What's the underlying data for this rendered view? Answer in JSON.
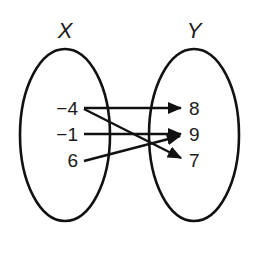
{
  "diagram": {
    "type": "mapping-diagram",
    "domain_set": {
      "label": "X",
      "values": [
        "−4",
        "−1",
        "6"
      ]
    },
    "range_set": {
      "label": "Y",
      "values": [
        "8",
        "9",
        "7"
      ]
    },
    "mappings": [
      {
        "from": "−4",
        "to": "8"
      },
      {
        "from": "−4",
        "to": "7"
      },
      {
        "from": "−1",
        "to": "9"
      },
      {
        "from": "6",
        "to": "9"
      }
    ],
    "colors": {
      "stroke": "#111111",
      "text": "#1a1a1a",
      "background": "#ffffff"
    }
  }
}
